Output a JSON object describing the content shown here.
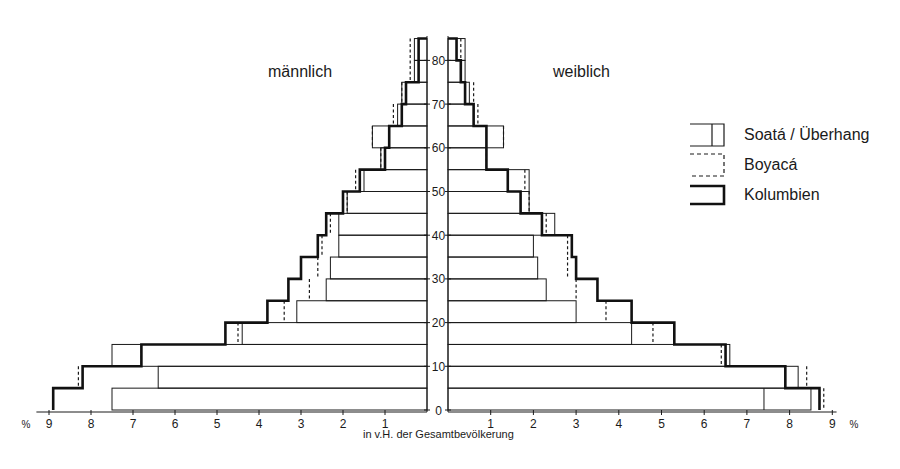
{
  "titles": {
    "male": "männlich",
    "female": "weiblich"
  },
  "axis": {
    "caption": "in v.H. der Gesamtbevölkerung",
    "percent_symbol": "%",
    "x_ticks": [
      9,
      8,
      7,
      6,
      5,
      4,
      3,
      2,
      1
    ],
    "x_ticks_right": [
      1,
      2,
      3,
      4,
      5,
      6,
      7,
      8,
      9
    ],
    "age_ticks": [
      0,
      10,
      20,
      30,
      40,
      50,
      60,
      70,
      80
    ]
  },
  "legend": {
    "items": [
      {
        "label": "Soatá / Überhang",
        "style": "thin-solid-box-with-divider"
      },
      {
        "label": "Boyacá",
        "style": "dashed"
      },
      {
        "label": "Kolumbien",
        "style": "thick-solid"
      }
    ]
  },
  "chart_data": {
    "type": "bar",
    "subtype": "population-pyramid",
    "title": "",
    "xlabel": "in v.H. der Gesamtbevölkerung",
    "ylabel": "Alter",
    "xlim": [
      0,
      9
    ],
    "ylim": [
      0,
      85
    ],
    "grid": false,
    "legend_position": "right",
    "categories": [
      "0-4",
      "5-9",
      "10-14",
      "15-19",
      "20-24",
      "25-29",
      "30-34",
      "35-39",
      "40-44",
      "45-49",
      "50-54",
      "55-59",
      "60-64",
      "65-69",
      "70-74",
      "75-79",
      "80-84"
    ],
    "male": {
      "label": "männlich",
      "series": [
        {
          "name": "Soatá / Überhang",
          "values": [
            7.5,
            6.4,
            7.5,
            4.4,
            3.1,
            2.4,
            2.3,
            2.1,
            2.1,
            1.9,
            1.5,
            1.1,
            1.3,
            0.7,
            0.6,
            0.3,
            0.3
          ]
        },
        {
          "name": "Boyacá",
          "values": [
            8.9,
            8.3,
            6.8,
            4.5,
            3.4,
            2.8,
            2.6,
            2.5,
            2.3,
            1.9,
            1.7,
            1.1,
            1.3,
            0.8,
            0.6,
            0.4,
            0.4
          ]
        },
        {
          "name": "Kolumbien",
          "values": [
            8.9,
            8.2,
            6.8,
            4.8,
            3.8,
            3.3,
            3.0,
            2.6,
            2.4,
            2.0,
            1.6,
            1.0,
            0.9,
            0.6,
            0.5,
            0.2,
            0.2
          ]
        }
      ],
      "soata_divider": [
        null,
        null,
        6.8,
        null,
        null,
        null,
        null,
        null,
        null,
        null,
        null,
        null,
        0.9,
        null,
        null,
        null,
        null
      ]
    },
    "female": {
      "label": "weiblich",
      "series": [
        {
          "name": "Soatá / Überhang",
          "values": [
            8.5,
            8.2,
            6.6,
            4.3,
            3.0,
            2.3,
            2.1,
            2.0,
            2.5,
            1.9,
            1.9,
            0.9,
            1.3,
            0.6,
            0.5,
            0.4,
            0.4
          ]
        },
        {
          "name": "Boyacá",
          "values": [
            8.8,
            8.4,
            6.4,
            4.8,
            3.7,
            3.0,
            2.8,
            2.8,
            2.3,
            1.9,
            1.8,
            0.9,
            1.3,
            0.7,
            0.6,
            0.3,
            0.3
          ]
        },
        {
          "name": "Kolumbien",
          "values": [
            8.7,
            7.9,
            6.5,
            5.3,
            4.3,
            3.5,
            3.0,
            2.9,
            2.2,
            1.7,
            1.4,
            0.9,
            0.9,
            0.6,
            0.4,
            0.3,
            0.2
          ]
        }
      ],
      "soata_divider": [
        7.4,
        null,
        null,
        null,
        null,
        null,
        null,
        null,
        2.2,
        1.7,
        1.4,
        null,
        0.9,
        null,
        null,
        null,
        null
      ]
    }
  }
}
